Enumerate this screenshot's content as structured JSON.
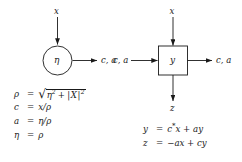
{
  "figure": {
    "type": "signal-flow-diagram",
    "background_color": "#ffffff",
    "line_color": "#1a1a1a"
  },
  "left_cell": {
    "name": "boundary-cell",
    "shape": "circle",
    "node_label": "η",
    "input_top": "x",
    "output_right": "c, a"
  },
  "right_cell": {
    "name": "internal-cell",
    "shape": "square",
    "node_label": "y",
    "input_top": "x",
    "input_left": "c, a",
    "output_right": "c, a",
    "output_bottom": "z"
  },
  "left_equations": [
    {
      "lhs": "ρ",
      "rhs_kind": "radical",
      "rhs_radicand_a": "η",
      "rhs_radicand_a_sup": "2",
      "rhs_plus": "+",
      "rhs_bar_open": "|",
      "rhs_radicand_b": "X",
      "rhs_bar_close": "|",
      "rhs_radicand_b_sup": "2"
    },
    {
      "lhs": "c",
      "rhs_kind": "plain",
      "rhs": "x/ρ"
    },
    {
      "lhs": "a",
      "rhs_kind": "plain",
      "rhs": "η/ρ"
    },
    {
      "lhs": "η",
      "rhs_kind": "plain",
      "rhs": "ρ"
    }
  ],
  "right_equations": [
    {
      "lhs": "y",
      "pre": "c",
      "sup": "*",
      "post": "x + ay"
    },
    {
      "lhs": "z",
      "pre": "−a",
      "sup": "",
      "post": "x + cy"
    }
  ],
  "equals_sign": "="
}
